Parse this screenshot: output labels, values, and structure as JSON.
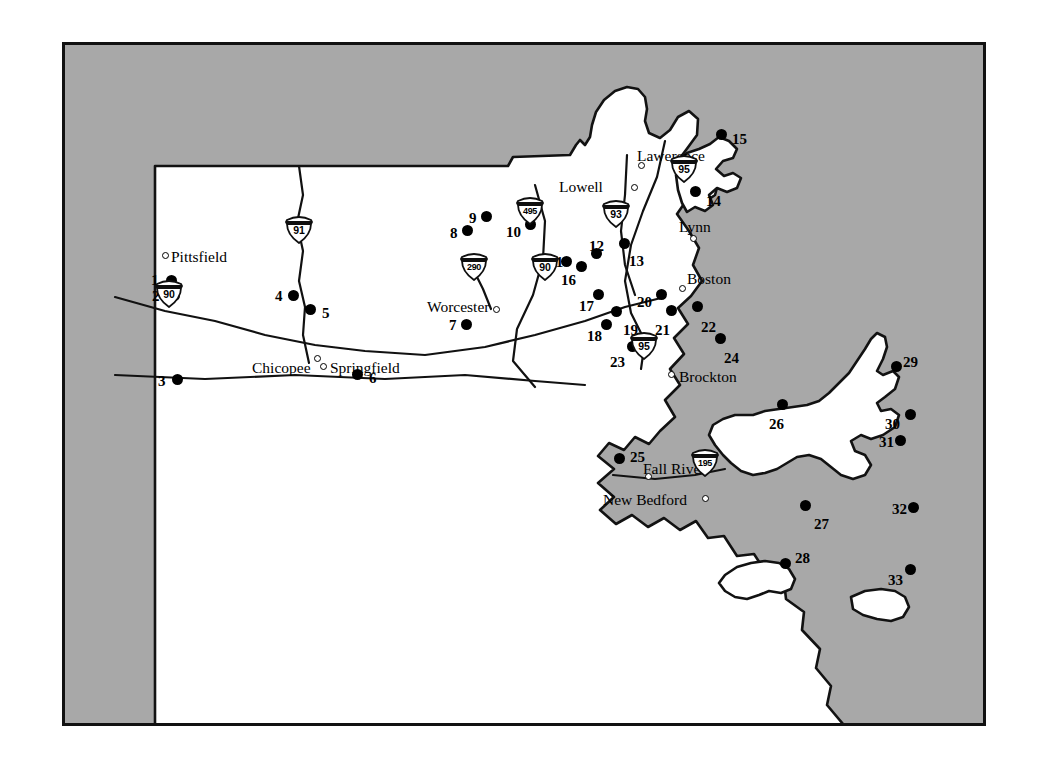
{
  "figure": {
    "type": "reference-map",
    "region": "Massachusetts",
    "background_color": "#a8a8a8",
    "land_color": "#ffffff",
    "ink_color": "#000000",
    "frame": {
      "x": 62,
      "y": 42,
      "width": 924,
      "height": 684,
      "border_width": 3
    }
  },
  "cities": [
    {
      "name": "Pittsfield",
      "label_x": 168,
      "label_y": 246,
      "dot_x": 159,
      "dot_y": 249
    },
    {
      "name": "Chicopee",
      "label_x": 249,
      "label_y": 357,
      "dot_x": 311,
      "dot_y": 352
    },
    {
      "name": "Springfield",
      "label_x": 327,
      "label_y": 357,
      "dot_x": 317,
      "dot_y": 360
    },
    {
      "name": "Worcester",
      "label_x": 424,
      "label_y": 296,
      "dot_x": 490,
      "dot_y": 303
    },
    {
      "name": "Lowell",
      "label_x": 556,
      "label_y": 176,
      "dot_x": 628,
      "dot_y": 181
    },
    {
      "name": "Lawerence",
      "label_x": 634,
      "label_y": 145,
      "dot_x": 635,
      "dot_y": 159
    },
    {
      "name": "Lynn",
      "label_x": 676,
      "label_y": 216,
      "dot_x": 687,
      "dot_y": 232
    },
    {
      "name": "Boston",
      "label_x": 684,
      "label_y": 268,
      "dot_x": 676,
      "dot_y": 282
    },
    {
      "name": "Brockton",
      "label_x": 676,
      "label_y": 366,
      "dot_x": 665,
      "dot_y": 368
    },
    {
      "name": "Fall River",
      "label_x": 640,
      "label_y": 458,
      "dot_x": 642,
      "dot_y": 470
    },
    {
      "name": "New Bedford",
      "label_x": 600,
      "label_y": 489,
      "dot_x": 699,
      "dot_y": 492
    }
  ],
  "highway_shields": [
    {
      "route": "91",
      "x": 296,
      "y": 227
    },
    {
      "route": "90",
      "x": 166,
      "y": 291
    },
    {
      "route": "495",
      "x": 527,
      "y": 208
    },
    {
      "route": "290",
      "x": 471,
      "y": 264
    },
    {
      "route": "90",
      "x": 542,
      "y": 264
    },
    {
      "route": "93",
      "x": 613,
      "y": 211
    },
    {
      "route": "95",
      "x": 681,
      "y": 166
    },
    {
      "route": "95",
      "x": 641,
      "y": 343
    },
    {
      "route": "195",
      "x": 702,
      "y": 460
    }
  ],
  "sites": [
    {
      "id": "1",
      "dot_x": 168,
      "dot_y": 277,
      "label_x": 148,
      "label_y": 270
    },
    {
      "id": "2",
      "dot_x": 171,
      "dot_y": 292,
      "label_x": 149,
      "label_y": 286
    },
    {
      "id": "3",
      "dot_x": 174,
      "dot_y": 376,
      "label_x": 155,
      "label_y": 371
    },
    {
      "id": "4",
      "dot_x": 290,
      "dot_y": 292,
      "label_x": 272,
      "label_y": 286
    },
    {
      "id": "5",
      "dot_x": 307,
      "dot_y": 306,
      "label_x": 319,
      "label_y": 303
    },
    {
      "id": "6",
      "dot_x": 354,
      "dot_y": 371,
      "label_x": 366,
      "label_y": 368
    },
    {
      "id": "7",
      "dot_x": 463,
      "dot_y": 321,
      "label_x": 446,
      "label_y": 315
    },
    {
      "id": "8",
      "dot_x": 464,
      "dot_y": 227,
      "label_x": 447,
      "label_y": 223
    },
    {
      "id": "9",
      "dot_x": 483,
      "dot_y": 213,
      "label_x": 466,
      "label_y": 208
    },
    {
      "id": "10",
      "dot_x": 527,
      "dot_y": 221,
      "label_x": 503,
      "label_y": 222
    },
    {
      "id": "11",
      "dot_x": 563,
      "dot_y": 258,
      "label_x": 546,
      "label_y": 252
    },
    {
      "id": "12",
      "dot_x": 593,
      "dot_y": 250,
      "label_x": 586,
      "label_y": 236
    },
    {
      "id": "13",
      "dot_x": 621,
      "dot_y": 240,
      "label_x": 626,
      "label_y": 251
    },
    {
      "id": "14",
      "dot_x": 692,
      "dot_y": 188,
      "label_x": 703,
      "label_y": 191
    },
    {
      "id": "15",
      "dot_x": 718,
      "dot_y": 131,
      "label_x": 729,
      "label_y": 129
    },
    {
      "id": "16",
      "dot_x": 578,
      "dot_y": 263,
      "label_x": 558,
      "label_y": 270
    },
    {
      "id": "17",
      "dot_x": 595,
      "dot_y": 291,
      "label_x": 576,
      "label_y": 296
    },
    {
      "id": "18",
      "dot_x": 603,
      "dot_y": 321,
      "label_x": 584,
      "label_y": 326
    },
    {
      "id": "19",
      "dot_x": 613,
      "dot_y": 308,
      "label_x": 620,
      "label_y": 320
    },
    {
      "id": "20",
      "dot_x": 658,
      "dot_y": 291,
      "label_x": 634,
      "label_y": 292
    },
    {
      "id": "21",
      "dot_x": 668,
      "dot_y": 307,
      "label_x": 652,
      "label_y": 320
    },
    {
      "id": "22",
      "dot_x": 694,
      "dot_y": 303,
      "label_x": 698,
      "label_y": 317
    },
    {
      "id": "23",
      "dot_x": 629,
      "dot_y": 343,
      "label_x": 607,
      "label_y": 352
    },
    {
      "id": "24",
      "dot_x": 717,
      "dot_y": 335,
      "label_x": 721,
      "label_y": 348
    },
    {
      "id": "25",
      "dot_x": 616,
      "dot_y": 455,
      "label_x": 627,
      "label_y": 447
    },
    {
      "id": "26",
      "dot_x": 779,
      "dot_y": 401,
      "label_x": 766,
      "label_y": 414
    },
    {
      "id": "27",
      "dot_x": 802,
      "dot_y": 502,
      "label_x": 811,
      "label_y": 514
    },
    {
      "id": "28",
      "dot_x": 782,
      "dot_y": 560,
      "label_x": 792,
      "label_y": 548
    },
    {
      "id": "29",
      "dot_x": 893,
      "dot_y": 363,
      "label_x": 900,
      "label_y": 352
    },
    {
      "id": "30",
      "dot_x": 907,
      "dot_y": 411,
      "label_x": 882,
      "label_y": 414
    },
    {
      "id": "31",
      "dot_x": 897,
      "dot_y": 437,
      "label_x": 876,
      "label_y": 432
    },
    {
      "id": "32",
      "dot_x": 910,
      "dot_y": 504,
      "label_x": 889,
      "label_y": 499
    },
    {
      "id": "33",
      "dot_x": 907,
      "dot_y": 566,
      "label_x": 885,
      "label_y": 570
    }
  ]
}
